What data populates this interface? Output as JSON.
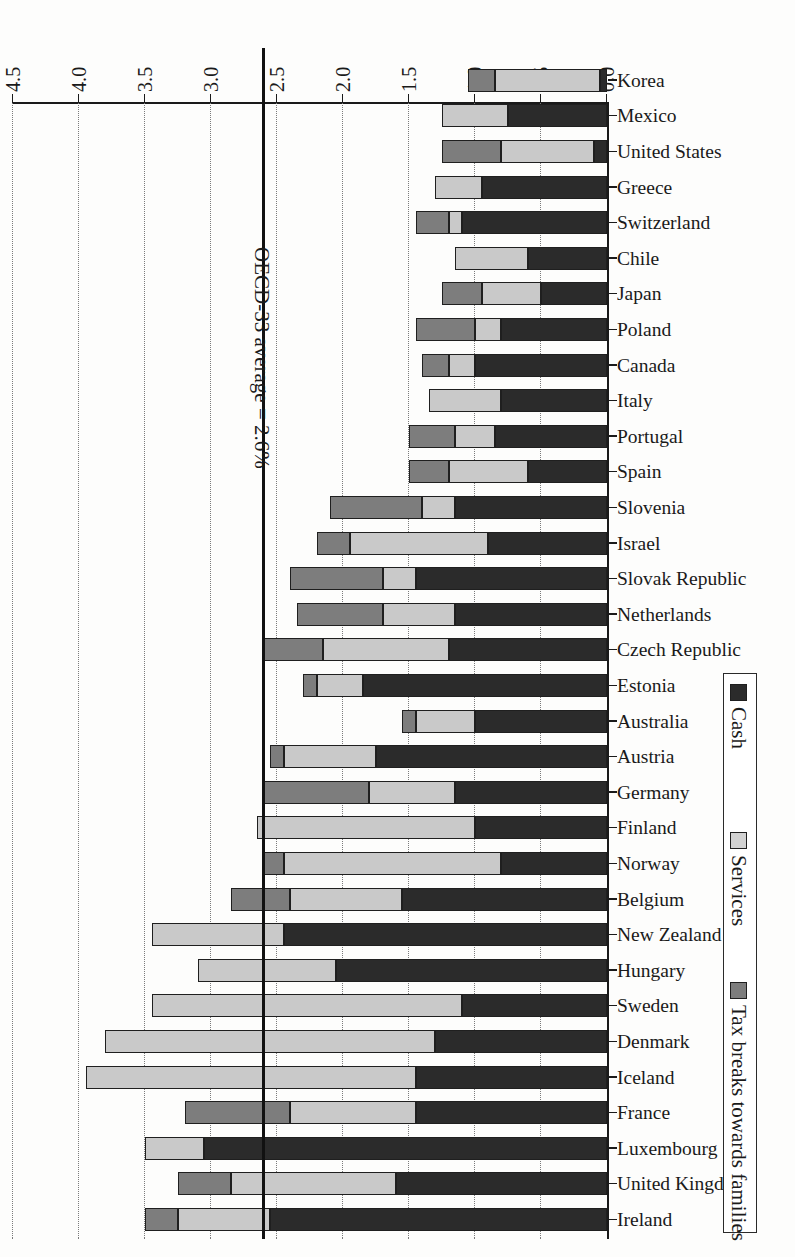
{
  "chart_data": {
    "type": "bar",
    "orientation": "horizontal-stacked",
    "title": "",
    "xlabel": "",
    "ylabel": "",
    "xlim": [
      0.0,
      4.5
    ],
    "xticks": [
      "0.0",
      "0.5",
      "1.0",
      "1.5",
      "2.0",
      "2.5",
      "3.0",
      "3.5",
      "4.0",
      "4.5"
    ],
    "grid": true,
    "legend_position": "top-left",
    "legend": [
      "Cash",
      "Services",
      "Tax breaks towards families"
    ],
    "annotation": "OECD-33 average = 2.6%",
    "annotation_value": 2.6,
    "series": [
      {
        "name": "Cash",
        "key": "cash"
      },
      {
        "name": "Services",
        "key": "services"
      },
      {
        "name": "Tax breaks towards families",
        "key": "tax"
      }
    ],
    "categories": [
      "Ireland",
      "United Kingdom",
      "Luxembourg",
      "France",
      "Iceland",
      "Denmark",
      "Sweden",
      "Hungary",
      "New Zealand",
      "Belgium",
      "Norway",
      "Finland",
      "Germany",
      "Austria",
      "Australia",
      "Estonia",
      "Czech Republic",
      "Netherlands",
      "Slovak Republic",
      "Israel",
      "Slovenia",
      "Spain",
      "Portugal",
      "Italy",
      "Canada",
      "Poland",
      "Japan",
      "Chile",
      "Switzerland",
      "Greece",
      "United States",
      "Mexico",
      "Korea"
    ],
    "values": {
      "cash": [
        2.55,
        1.6,
        3.05,
        1.45,
        1.45,
        1.3,
        1.1,
        2.05,
        2.45,
        1.55,
        0.8,
        1.0,
        1.15,
        1.75,
        1.0,
        1.85,
        1.2,
        1.15,
        1.45,
        0.9,
        1.15,
        0.6,
        0.85,
        0.8,
        1.0,
        0.8,
        0.5,
        0.6,
        1.1,
        0.95,
        0.1,
        0.75,
        0.05
      ],
      "services": [
        0.7,
        1.25,
        0.45,
        0.95,
        2.5,
        2.5,
        2.35,
        1.05,
        1.0,
        0.85,
        1.65,
        1.65,
        0.65,
        0.7,
        0.45,
        0.35,
        0.95,
        0.55,
        0.25,
        1.05,
        0.25,
        0.6,
        0.3,
        0.55,
        0.2,
        0.2,
        0.45,
        0.55,
        0.1,
        0.35,
        0.7,
        0.5,
        0.8
      ],
      "tax": [
        0.25,
        0.4,
        0.0,
        0.8,
        0.0,
        0.0,
        0.0,
        0.0,
        0.0,
        0.45,
        0.15,
        0.0,
        0.8,
        0.1,
        0.1,
        0.1,
        0.45,
        0.65,
        0.7,
        0.25,
        0.7,
        0.3,
        0.35,
        0.0,
        0.2,
        0.45,
        0.3,
        0.0,
        0.25,
        0.0,
        0.45,
        0.0,
        0.2
      ]
    },
    "totals": [
      3.5,
      3.25,
      3.5,
      3.2,
      3.95,
      3.8,
      3.45,
      3.1,
      3.45,
      2.85,
      2.6,
      2.65,
      2.6,
      2.55,
      1.55,
      2.3,
      2.6,
      2.35,
      2.4,
      2.2,
      2.1,
      1.5,
      1.5,
      1.35,
      1.4,
      1.45,
      1.25,
      1.15,
      1.45,
      1.3,
      1.25,
      1.25,
      1.05
    ]
  }
}
